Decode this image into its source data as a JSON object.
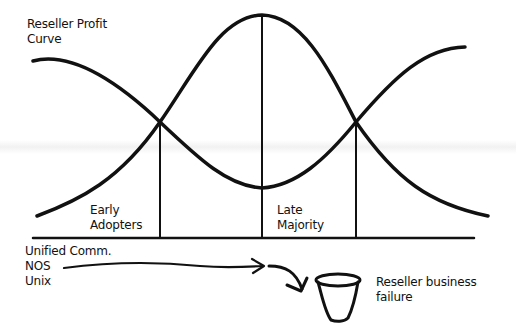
{
  "diagram": {
    "title": [
      "Reseller Profit",
      "Curve"
    ],
    "curves": {
      "adoption_bell_curve": "Technology adoption bell curve",
      "reseller_profit_curve": "Reseller profit curve (U-shaped)"
    },
    "segments": [
      {
        "label": [
          "Early",
          "Adopters"
        ]
      },
      {
        "label": [
          "Late",
          "Majority"
        ]
      }
    ],
    "technologies": [
      "Unified Comm.",
      "NOS",
      "Unix"
    ],
    "outcome": {
      "icon": "bucket-icon",
      "label": [
        "Reseller business",
        "failure"
      ]
    },
    "colors": {
      "line": "#111111",
      "background": "#ffffff"
    }
  }
}
